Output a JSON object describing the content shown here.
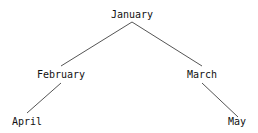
{
  "diagram": {
    "type": "tree",
    "nodes": [
      {
        "id": "january",
        "label": "January",
        "x": 132,
        "y": 9
      },
      {
        "id": "february",
        "label": "February",
        "x": 61,
        "y": 69
      },
      {
        "id": "march",
        "label": "March",
        "x": 202,
        "y": 69
      },
      {
        "id": "april",
        "label": "April",
        "x": 27,
        "y": 116
      },
      {
        "id": "may",
        "label": "May",
        "x": 237,
        "y": 116
      }
    ],
    "edges": [
      {
        "from": "january",
        "to": "february"
      },
      {
        "from": "january",
        "to": "march"
      },
      {
        "from": "february",
        "to": "april"
      },
      {
        "from": "march",
        "to": "may"
      }
    ],
    "line_color": "#555555",
    "text_color": "#111111"
  }
}
